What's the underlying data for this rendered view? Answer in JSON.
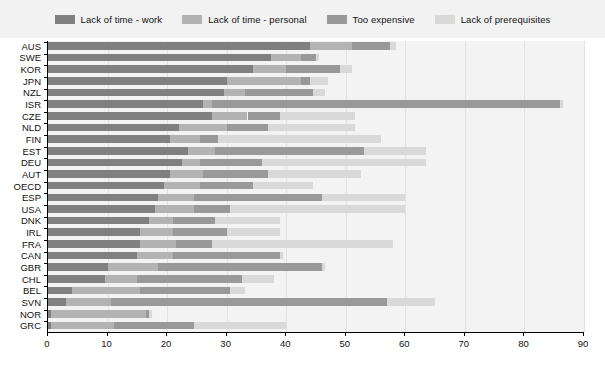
{
  "legend": {
    "items": [
      {
        "label": "Lack of time - work",
        "color": "#808080",
        "icon": "legend-swatch"
      },
      {
        "label": "Lack of time - personal",
        "color": "#b3b3b3",
        "icon": "legend-swatch"
      },
      {
        "label": "Too expensive",
        "color": "#999999",
        "icon": "legend-swatch"
      },
      {
        "label": "Lack of prerequisites",
        "color": "#d9d9d9",
        "icon": "legend-swatch"
      }
    ]
  },
  "axis": {
    "x_ticks": [
      "0",
      "10",
      "20",
      "30",
      "40",
      "50",
      "60",
      "70",
      "80",
      "90"
    ],
    "x_min": 0,
    "x_max": 90
  },
  "chart_data": {
    "type": "bar",
    "orientation": "horizontal",
    "stacked": true,
    "title": "",
    "xlabel": "",
    "ylabel": "",
    "xlim": [
      0,
      90
    ],
    "grid": true,
    "legend_position": "top",
    "categories": [
      "AUS",
      "SWE",
      "KOR",
      "JPN",
      "NZL",
      "ISR",
      "CZE",
      "NLD",
      "FIN",
      "EST",
      "DEU",
      "AUT",
      "OECD",
      "ESP",
      "USA",
      "DNK",
      "IRL",
      "FRA",
      "CAN",
      "GBR",
      "CHL",
      "BEL",
      "SVN",
      "NOR",
      "GRC"
    ],
    "series": [
      {
        "name": "Lack of time - work",
        "color": "#808080",
        "values": [
          44.0,
          37.5,
          34.5,
          30.0,
          29.5,
          26.0,
          27.5,
          22.0,
          20.5,
          23.5,
          22.5,
          20.5,
          19.5,
          18.5,
          18.0,
          17.0,
          15.5,
          15.5,
          15.0,
          10.0,
          9.5,
          4.0,
          3.0,
          0.5,
          0.5
        ]
      },
      {
        "name": "Lack of time - personal",
        "color": "#b3b3b3",
        "values": [
          7.0,
          5.0,
          5.5,
          12.5,
          3.5,
          1.5,
          6.0,
          8.0,
          5.0,
          4.5,
          3.0,
          5.5,
          6.0,
          6.0,
          6.5,
          4.0,
          5.5,
          6.0,
          6.0,
          8.5,
          5.5,
          11.5,
          7.5,
          16.0,
          10.5
        ]
      },
      {
        "name": "Too expensive",
        "color": "#999999",
        "values": [
          6.5,
          2.5,
          9.0,
          1.5,
          11.5,
          58.5,
          5.5,
          7.0,
          3.0,
          25.0,
          10.5,
          11.0,
          9.0,
          21.5,
          6.0,
          7.0,
          9.0,
          6.0,
          18.0,
          27.5,
          17.5,
          15.0,
          46.5,
          0.5,
          13.5
        ]
      },
      {
        "name": "Lack of prerequisites",
        "color": "#d9d9d9",
        "values": [
          1.0,
          0.5,
          2.0,
          3.0,
          2.0,
          0.5,
          12.5,
          14.5,
          27.5,
          10.5,
          27.5,
          15.5,
          10.0,
          14.0,
          29.5,
          11.0,
          9.0,
          30.5,
          0.5,
          0.5,
          5.5,
          2.5,
          8.0,
          0.5,
          15.5
        ]
      }
    ],
    "totals": [
      58.5,
      45.5,
      51.0,
      47.0,
      46.5,
      86.5,
      51.5,
      51.5,
      56.0,
      63.5,
      63.5,
      52.5,
      44.5,
      60.0,
      60.0,
      39.0,
      39.0,
      58.0,
      39.5,
      46.5,
      38.0,
      33.0,
      65.0,
      17.5,
      40.0
    ]
  }
}
